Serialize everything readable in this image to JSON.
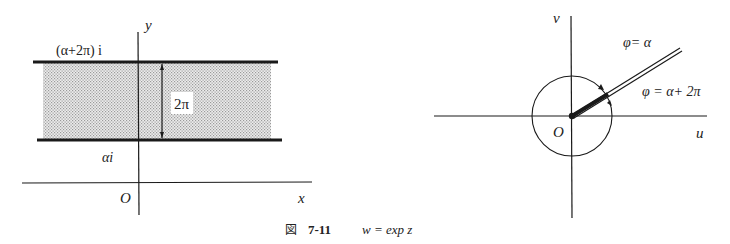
{
  "figure": {
    "caption_prefix": "図",
    "caption_number": "7-11",
    "caption_formula": "w = exp z"
  },
  "left_panel": {
    "title": "z-plane strip",
    "axes": {
      "x_label": "x",
      "y_label": "y",
      "origin_label": "O"
    },
    "upper_line_label": "(α+2π) i",
    "lower_line_label": "αi",
    "strip_width_label": "2π",
    "colors": {
      "line": "#1a1a1a",
      "strip_fill": "#d6d6d6",
      "background": "#ffffff"
    }
  },
  "right_panel": {
    "title": "w-plane",
    "axes": {
      "u_label": "u",
      "v_label": "v",
      "origin_label": "O"
    },
    "ray_label_top": "φ= α",
    "ray_label_bottom": "φ = α+ 2π",
    "colors": {
      "line": "#1a1a1a"
    }
  }
}
